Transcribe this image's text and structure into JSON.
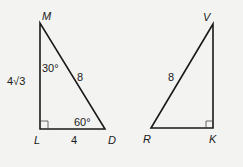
{
  "figure": {
    "background": "#f3f3f1",
    "stroke": "#1a1a1a",
    "triangle_left": {
      "vertices": {
        "M": "M",
        "L": "L",
        "D": "D"
      },
      "side_ML": "4√3",
      "side_MD": "8",
      "side_LD": "4",
      "angle_M": "30°",
      "angle_D": "60°",
      "right_angle_at": "L"
    },
    "triangle_right": {
      "vertices": {
        "V": "V",
        "R": "R",
        "K": "K"
      },
      "side_RV": "8",
      "right_angle_at": "K"
    }
  }
}
